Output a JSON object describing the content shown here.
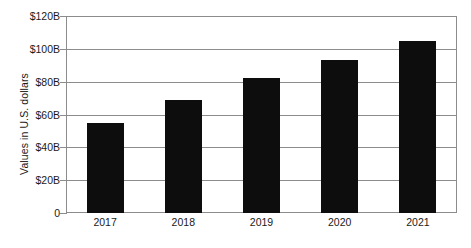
{
  "chart_data": {
    "type": "bar",
    "title": "",
    "subtitle": "",
    "xlabel": "",
    "ylabel": "Values in U.S. dollars",
    "categories": [
      "2017",
      "2018",
      "2019",
      "2020",
      "2021"
    ],
    "values": [
      55,
      69,
      82,
      93,
      105
    ],
    "value_unit": "billion U.S. dollars",
    "ylim": [
      0,
      120
    ],
    "ytick_values": [
      0,
      20,
      40,
      60,
      80,
      100,
      120
    ],
    "ytick_labels": [
      "0",
      "$20B",
      "$40B",
      "$60B",
      "$80B",
      "$100B",
      "$120B"
    ],
    "grid": true,
    "grid_axis": "y",
    "legend": false,
    "legend_position": "none",
    "series": [
      {
        "name": "Values in U.S. dollars",
        "values": [
          55,
          69,
          82,
          93,
          105
        ],
        "color": "#0d0d0d"
      }
    ],
    "colors": {
      "bar": "#0d0d0d",
      "grid": "#8c8c8c",
      "axis": "#8c8c8c",
      "text": "#1a1a1a",
      "background": "#ffffff"
    }
  }
}
